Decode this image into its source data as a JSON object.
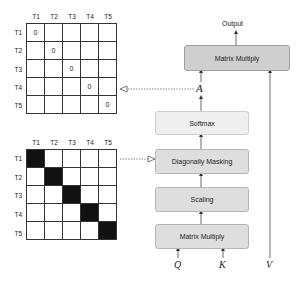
{
  "top_matrix": {
    "col_labels": [
      "T1",
      "T2",
      "T3",
      "T4",
      "T5"
    ],
    "row_labels": [
      "T1",
      "T2",
      "T3",
      "T4",
      "T5"
    ],
    "cells": [
      [
        "0",
        "",
        "",
        "",
        ""
      ],
      [
        "",
        "0",
        "",
        "",
        ""
      ],
      [
        "",
        "",
        "0",
        "",
        ""
      ],
      [
        "",
        "",
        "",
        "0",
        ""
      ],
      [
        "",
        "",
        "",
        "",
        "0"
      ]
    ]
  },
  "bottom_matrix": {
    "col_labels": [
      "T1",
      "T2",
      "T3",
      "T4",
      "T5"
    ],
    "row_labels": [
      "T1",
      "T2",
      "T3",
      "T4",
      "T5"
    ],
    "diagonal_filled_color": "#111111"
  },
  "flow": {
    "output_label": "Output",
    "matrix_multiply_top": "Matrix Multiply",
    "attention_symbol": "A",
    "softmax": "Softmax",
    "diagonal_masking": "Diagonally Masking",
    "scaling": "Scaling",
    "matrix_multiply_bottom": "Matrix Multiply",
    "inputs": {
      "q": "Q",
      "k": "K",
      "v": "V"
    }
  }
}
